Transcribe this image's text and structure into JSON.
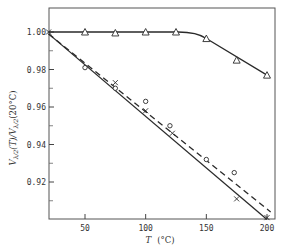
{
  "chart_data": {
    "type": "line",
    "title": "",
    "xlabel": "T (°C)",
    "ylabel": "V_{λ/2}(T)/V_{λ/2}(20°C)",
    "xlim": [
      20,
      206
    ],
    "ylim": [
      0.9,
      1.013
    ],
    "xticks": [
      50,
      100,
      150,
      200
    ],
    "xtick_labels": [
      "50",
      "100",
      "150",
      "200"
    ],
    "yticks": [
      0.92,
      0.94,
      0.96,
      0.98,
      1.0
    ],
    "ytick_labels": [
      "0.92",
      "0.94",
      "0.96",
      "0.98",
      "1.00"
    ],
    "yminor_ticks": [
      0.91,
      0.93,
      0.95,
      0.97,
      0.99
    ],
    "grid": false,
    "legend": null,
    "series": [
      {
        "name": "triangles",
        "marker": "triangle",
        "points": [
          [
            50,
            1.0
          ],
          [
            75,
            0.9995
          ],
          [
            100,
            1.0
          ],
          [
            125,
            1.0
          ],
          [
            150,
            0.9965
          ],
          [
            175,
            0.985
          ],
          [
            200,
            0.977
          ]
        ],
        "fit_line": {
          "style": "solid",
          "points": [
            [
              20,
              1.0
            ],
            [
              130,
              1.0
            ],
            [
              140,
              0.9995
            ],
            [
              150,
              0.997
            ],
            [
              175,
              0.987
            ],
            [
              200,
              0.977
            ]
          ]
        }
      },
      {
        "name": "crosses",
        "marker": "cross",
        "points": [
          [
            20,
            1.0
          ],
          [
            75,
            0.973
          ],
          [
            100,
            0.958
          ],
          [
            122,
            0.946
          ],
          [
            175,
            0.911
          ],
          [
            200,
            0.901
          ]
        ],
        "fit_line": {
          "style": "solid",
          "points": [
            [
              20,
              0.999
            ],
            [
              200,
              0.9
            ]
          ]
        }
      },
      {
        "name": "circles",
        "marker": "circle",
        "points": [
          [
            50,
            0.981
          ],
          [
            75,
            0.97
          ],
          [
            100,
            0.963
          ],
          [
            120,
            0.95
          ],
          [
            150,
            0.932
          ],
          [
            173,
            0.925
          ]
        ],
        "fit_line": {
          "style": "dashed",
          "points": [
            [
              20,
              0.999
            ],
            [
              203,
              0.904
            ]
          ]
        }
      }
    ]
  }
}
